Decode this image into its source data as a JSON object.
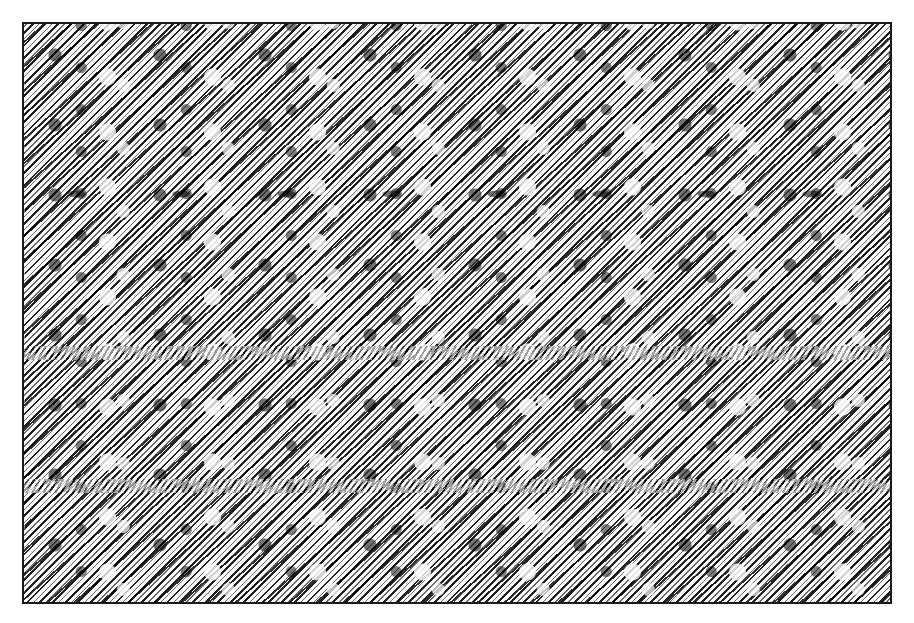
{
  "image": {
    "type": "autostereogram",
    "description": "Random diagonal-streak texture stereogram with black, gray and white hatching, framed by a thin dark border",
    "repeat_period_px": 105,
    "colors": {
      "dark": "#000000",
      "mid": "#808080",
      "light": "#ffffff",
      "border": "#1a1a1a",
      "page_background": "#ffffff"
    }
  }
}
